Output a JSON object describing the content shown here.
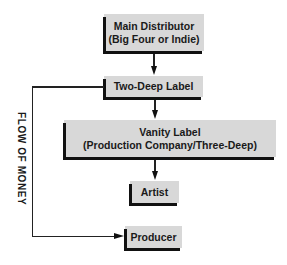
{
  "diagram": {
    "nodes": [
      {
        "id": "main-distributor",
        "line1": "Main Distributor",
        "line2": "(Big Four or Indie)"
      },
      {
        "id": "two-deep-label",
        "line1": "Two-Deep Label"
      },
      {
        "id": "vanity-label",
        "line1": "Vanity Label",
        "line2": "(Production Company/Three-Deep)"
      },
      {
        "id": "artist",
        "line1": "Artist"
      },
      {
        "id": "producer",
        "line1": "Producer"
      }
    ],
    "edges": [
      {
        "from": "main-distributor",
        "to": "two-deep-label"
      },
      {
        "from": "two-deep-label",
        "to": "vanity-label"
      },
      {
        "from": "vanity-label",
        "to": "artist"
      },
      {
        "from": "two-deep-label",
        "to": "producer"
      }
    ],
    "side_label": "FLOW OF MONEY",
    "colors": {
      "box_fill": "#d8d8d8",
      "box_shadow": "#111111",
      "line": "#222222"
    }
  }
}
